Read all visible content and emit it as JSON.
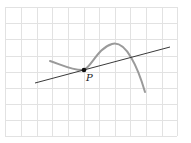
{
  "diagram": {
    "grid": {
      "x_lines": [
        5,
        21,
        37,
        52,
        68,
        84,
        99,
        115,
        130,
        146,
        162,
        177
      ],
      "y_lines": [
        7,
        23,
        39,
        56,
        72,
        88,
        104,
        120,
        136
      ],
      "color": "#e2e2e2"
    },
    "curve": {
      "color": "#9a9a9a",
      "path": "M 50 61 C 62 65, 74 71, 84 70 C 92 66, 98 48, 112 44 C 126 40, 138 68, 145 92"
    },
    "line": {
      "color": "#3a3a3a",
      "x1": 35,
      "y1": 83,
      "x2": 170,
      "y2": 47
    },
    "point": {
      "label": "P",
      "x": 84,
      "y": 70,
      "label_x": 86,
      "label_y": 81,
      "color": "#111111"
    }
  }
}
